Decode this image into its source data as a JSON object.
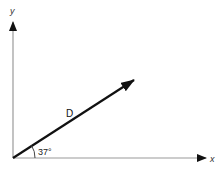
{
  "diagram": {
    "type": "vector-diagram",
    "axes": {
      "x_label": "x",
      "y_label": "y",
      "color": "#9a9a9a"
    },
    "vector": {
      "label": "D",
      "angle_label": "37°",
      "angle_degrees": 37,
      "color": "#111111"
    }
  }
}
